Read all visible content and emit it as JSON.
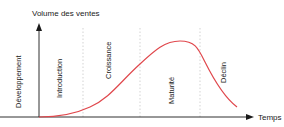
{
  "diagram": {
    "y_axis_label": "Volume des ventes",
    "x_axis_label": "Temps",
    "curve_color": "#e0474c",
    "phases": [
      {
        "label": "Développement"
      },
      {
        "label": "Introduction"
      },
      {
        "label": "Croissance"
      },
      {
        "label": "Maturité"
      },
      {
        "label": "Déclin"
      }
    ]
  }
}
